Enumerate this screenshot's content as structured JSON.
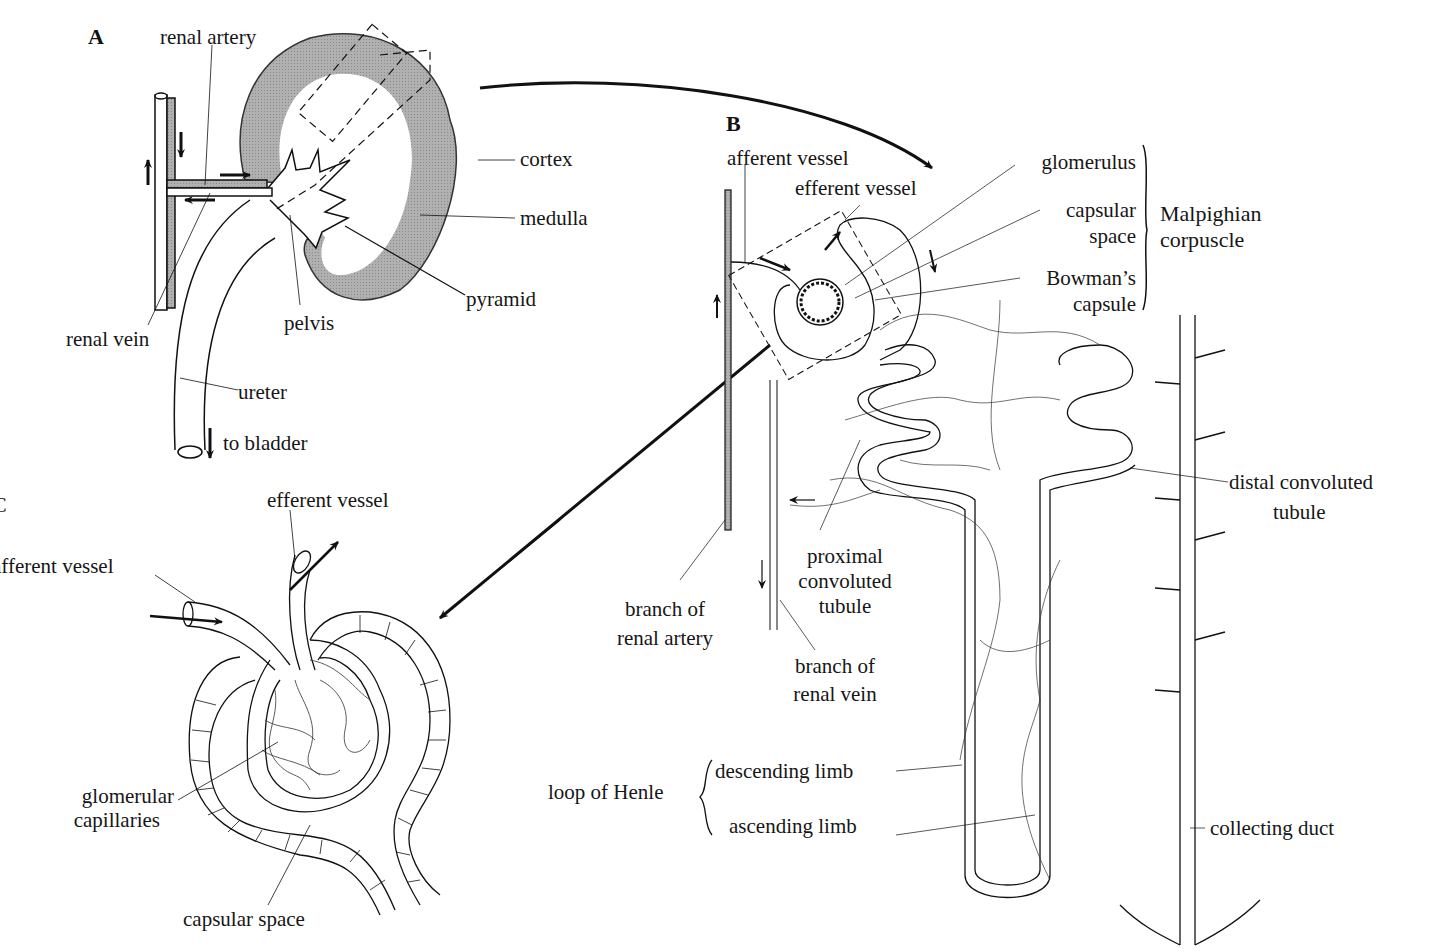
{
  "figure": {
    "panels": {
      "A": {
        "letter": "A",
        "labels": {
          "renal_artery": "renal artery",
          "renal_vein": "renal vein",
          "cortex": "cortex",
          "medulla": "medulla",
          "pyramid": "pyramid",
          "pelvis": "pelvis",
          "ureter": "ureter",
          "to_bladder": "to bladder"
        }
      },
      "B": {
        "letter": "B",
        "labels": {
          "afferent_vessel": "afferent vessel",
          "efferent_vessel": "efferent vessel",
          "glomerulus": "glomerulus",
          "capsular_space_1": "capsular",
          "capsular_space_2": "space",
          "bowmans_1": "Bowman’s",
          "bowmans_2": "capsule",
          "malpighian_1": "Malpighian",
          "malpighian_2": "corpuscle",
          "distal_1": "distal convoluted",
          "distal_2": "tubule",
          "proximal_1": "proximal",
          "proximal_2": "convoluted",
          "proximal_3": "tubule",
          "branch_artery_1": "branch of",
          "branch_artery_2": "renal artery",
          "branch_vein_1": "branch of",
          "branch_vein_2": "renal vein",
          "loop_of_henle": "loop of Henle",
          "descending_limb": "descending limb",
          "ascending_limb": "ascending limb",
          "collecting_duct": "collecting duct"
        }
      },
      "C": {
        "letter": "C",
        "labels": {
          "afferent_vessel": "afferent vessel",
          "efferent_vessel": "efferent vessel",
          "glomerular_1": "glomerular",
          "glomerular_2": "capillaries",
          "capsular_space": "capsular space"
        }
      }
    },
    "colors": {
      "ink": "#111111",
      "cortex_fill": "#a9a9a9",
      "background": "#ffffff"
    }
  }
}
